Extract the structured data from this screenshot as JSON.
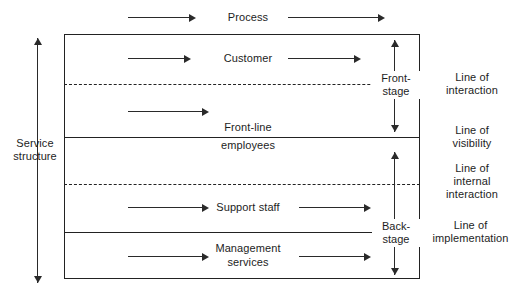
{
  "diagram": {
    "axis_label": {
      "name": "service-structure",
      "line1": "Service",
      "line2": "structure"
    },
    "rows": [
      {
        "name": "process",
        "label": "Process",
        "label_line1": "Process",
        "label_line2": ""
      },
      {
        "name": "customer",
        "label": "Customer",
        "label_line1": "Customer",
        "label_line2": ""
      },
      {
        "name": "front-line-employees",
        "label": "Front-line employees",
        "label_line1": "Front-line",
        "label_line2": "employees"
      },
      {
        "name": "support-staff",
        "label": "Support staff",
        "label_line1": "Support staff",
        "label_line2": ""
      },
      {
        "name": "management-services",
        "label": "Management services",
        "label_line1": "Management",
        "label_line2": "services"
      }
    ],
    "stages": [
      {
        "name": "front-stage",
        "label": "Front-stage",
        "line1": "Front-",
        "line2": "stage"
      },
      {
        "name": "back-stage",
        "label": "Back-stage",
        "line1": "Back-",
        "line2": "stage"
      }
    ],
    "boundary_lines": [
      {
        "name": "line-of-interaction",
        "label": "Line of interaction",
        "line1": "Line of",
        "line2": "interaction",
        "line3": "",
        "style": "dashed"
      },
      {
        "name": "line-of-visibility",
        "label": "Line of visibility",
        "line1": "Line of",
        "line2": "visibility",
        "line3": "",
        "style": "solid"
      },
      {
        "name": "line-of-internal-interaction",
        "label": "Line of internal interaction",
        "line1": "Line of",
        "line2": "internal",
        "line3": "interaction",
        "style": "dashed"
      },
      {
        "name": "line-of-implementation",
        "label": "Line of implementation",
        "line1": "Line of",
        "line2": "implementation",
        "line3": "",
        "style": "solid"
      }
    ],
    "colors": {
      "stroke": "#222222",
      "arrow": "#2a2a2a",
      "text": "#1d1d1d",
      "background": "#ffffff"
    }
  }
}
